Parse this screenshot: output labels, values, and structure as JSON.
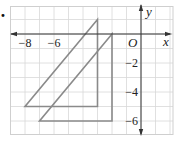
{
  "diagram": {
    "type": "coordinate-plane",
    "grid": {
      "x_range": [
        -9,
        2
      ],
      "y_range": [
        -7,
        2
      ],
      "step": 1,
      "grid_color": "#d8d8d8",
      "frame_color": "#cfcfcf"
    },
    "axes": {
      "x_label": "x",
      "y_label": "y",
      "origin_label": "O",
      "axis_color": "#333333"
    },
    "x_tick_labels": [
      {
        "value": -8,
        "text": "−8"
      },
      {
        "value": -6,
        "text": "−6"
      }
    ],
    "y_tick_labels": [
      {
        "value": -2,
        "text": "−2"
      },
      {
        "value": -4,
        "text": "−4"
      },
      {
        "value": -6,
        "text": "−6"
      }
    ],
    "shapes": [
      {
        "name": "triangle-original",
        "vertices": [
          [
            -3,
            1
          ],
          [
            -8,
            -5
          ],
          [
            -3,
            -5
          ]
        ],
        "stroke": "#8a8a8a"
      },
      {
        "name": "triangle-translated",
        "vertices": [
          [
            -2,
            0
          ],
          [
            -7,
            -6
          ],
          [
            -2,
            -6
          ]
        ],
        "stroke": "#8a8a8a"
      }
    ],
    "bullet_marker": "•"
  }
}
